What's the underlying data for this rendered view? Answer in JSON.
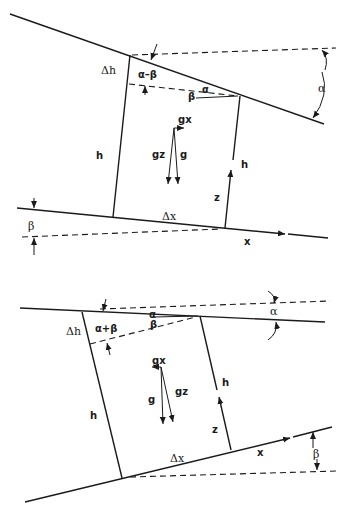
{
  "figure": {
    "top_panel": {
      "labels": {
        "delta_h": "Δh",
        "alpha_minus_beta": "α–β",
        "alpha_small": "α",
        "beta_small": "β",
        "alpha_right": "α",
        "g_x": "gx",
        "g_z": "gz",
        "g": "g",
        "h_left": "h",
        "h_right": "h",
        "z": "z",
        "delta_x": "Δx",
        "beta_left": "β",
        "x": "x"
      }
    },
    "bottom_panel": {
      "labels": {
        "delta_h": "Δh",
        "alpha_plus_beta": "α+β",
        "alpha_small": "α",
        "beta_small": "β",
        "alpha_right": "α",
        "g_x": "gx",
        "g": "g",
        "g_z": "gz",
        "h_left": "h",
        "h_right": "h",
        "z": "z",
        "delta_x": "Δx",
        "x": "x",
        "beta_right": "β"
      }
    },
    "colors": {
      "ink": "#1a1a1a",
      "background": "#ffffff"
    }
  }
}
